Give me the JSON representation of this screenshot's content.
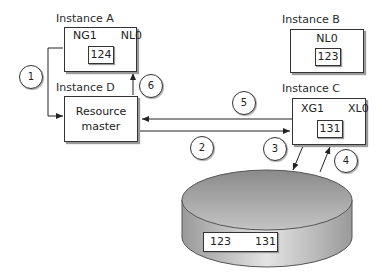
{
  "diagram": {
    "instances": {
      "a": {
        "title": "Instance A",
        "transition": {
          "from": "NG1",
          "to": "NL0"
        },
        "block": "124"
      },
      "b": {
        "title": "Instance B",
        "state": "NL0",
        "block": "123"
      },
      "c": {
        "title": "Instance C",
        "transition": {
          "from": "XG1",
          "to": "XL0"
        },
        "block": "131"
      },
      "d": {
        "title": "Instance D",
        "role_line1": "Resource",
        "role_line2": "master"
      }
    },
    "disk": {
      "transition": {
        "from": "123",
        "to": "131"
      }
    },
    "steps": [
      "1",
      "2",
      "3",
      "4",
      "5",
      "6"
    ],
    "colors": {
      "stroke": "#333333",
      "disk_dark": "#8a8a8a",
      "disk_light": "#d8d8d8",
      "shadow": "#9a9a9a"
    }
  }
}
